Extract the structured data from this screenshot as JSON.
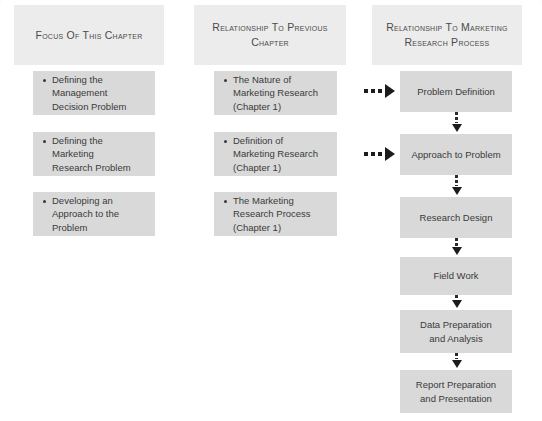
{
  "columns": [
    {
      "id": "focus-of-this-chapter",
      "header": "Focus of This\nChapter",
      "items": [
        {
          "text": "Defining the\nManagement\nDecision Problem"
        },
        {
          "text": "Defining the\nMarketing\nResearch Problem"
        },
        {
          "text": "Developing an\nApproach to the\nProblem"
        }
      ]
    },
    {
      "id": "relationship-to-previous-chapter",
      "header": "Relationship to\nPrevious Chapter",
      "items": [
        {
          "text": "The Nature of\nMarketing Research\n(Chapter 1)"
        },
        {
          "text": "Definition of\nMarketing Research\n(Chapter 1)"
        },
        {
          "text": "The Marketing\nResearch  Process\n(Chapter 1)"
        }
      ]
    },
    {
      "id": "relationship-to-marketing-research-process",
      "header": "Relationship to Marketing\nResearch Process",
      "items": [
        {
          "text": "Problem Definition"
        },
        {
          "text": "Approach to Problem"
        },
        {
          "text": "Research Design"
        },
        {
          "text": "Field Work"
        },
        {
          "text": "Data Preparation\nand Analysis"
        },
        {
          "text": "Report Preparation\nand Presentation"
        }
      ]
    }
  ],
  "connectors": {
    "horizontal": [
      {
        "target": "Problem Definition",
        "style": "dotted-arrow-right"
      },
      {
        "target": "Approach to Problem",
        "style": "dotted-arrow-right"
      }
    ],
    "vertical": [
      {
        "from": "Problem Definition",
        "to": "Approach to Problem",
        "style": "dotted-arrow-down"
      },
      {
        "from": "Approach to Problem",
        "to": "Research Design",
        "style": "dotted-arrow-down"
      },
      {
        "from": "Research Design",
        "to": "Field Work",
        "style": "dotted-arrow-down"
      },
      {
        "from": "Field Work",
        "to": "Data Preparation and Analysis",
        "style": "dotted-arrow-down"
      },
      {
        "from": "Data Preparation and Analysis",
        "to": "Report Preparation and Presentation",
        "style": "dotted-arrow-down"
      }
    ]
  },
  "colors": {
    "background": "#ffffff",
    "header_fill": "#ececec",
    "box_fill": "#d9d9d9",
    "text": "#3a3a3a",
    "arrow": "#1c1c1c"
  }
}
